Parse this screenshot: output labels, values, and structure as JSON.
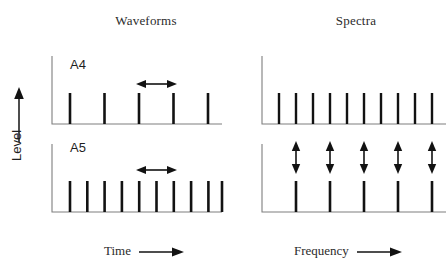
{
  "figure": {
    "columns": {
      "left_title": "Waveforms",
      "right_title": "Spectra"
    },
    "axis_labels": {
      "y": "Level",
      "y_arrow": "up-arrow",
      "x_left": "Time",
      "x_right": "Frequency",
      "x_arrow": "right-arrow"
    },
    "panels": [
      {
        "id": "a4-waveform",
        "label": "A4"
      },
      {
        "id": "a4-spectrum",
        "label": ""
      },
      {
        "id": "a5-waveform",
        "label": "A5"
      },
      {
        "id": "a5-spectrum",
        "label": ""
      }
    ],
    "colors": {
      "ink": "#121212",
      "axis": "#7f7f7f",
      "text": "#2b2b2b",
      "background": "#ffffff"
    }
  },
  "chart_data": [
    {
      "type": "bar",
      "id": "a4-waveform",
      "title": "A4",
      "panel_group": "Waveforms",
      "xlabel": "Time",
      "ylabel": "Level",
      "grid": false,
      "legend": "none",
      "x": [
        70,
        104.5,
        139,
        173.5,
        208
      ],
      "values": [
        1,
        1,
        1,
        1,
        1
      ],
      "axis_origin_x": 52,
      "axis_baseline_y": 124,
      "axis_top_y": 56,
      "axis_right_x": 222,
      "spike_top_y": 93,
      "annotations": [
        {
          "type": "double-arrow-horizontal",
          "meaning": "period",
          "x1": 139,
          "x2": 173.5,
          "y": 84
        }
      ]
    },
    {
      "type": "bar",
      "id": "a4-spectrum",
      "title": "",
      "panel_group": "Spectra",
      "xlabel": "Frequency",
      "ylabel": "Level",
      "grid": false,
      "legend": "none",
      "x": [
        279,
        296,
        313,
        330,
        347,
        364,
        381,
        398,
        415,
        432
      ],
      "values": [
        1,
        1,
        1,
        1,
        1,
        1,
        1,
        1,
        1,
        1
      ],
      "axis_origin_x": 262,
      "axis_baseline_y": 124,
      "axis_top_y": 56,
      "axis_right_x": 446,
      "spike_top_y": 93,
      "annotations": []
    },
    {
      "type": "bar",
      "id": "a5-waveform",
      "title": "A5",
      "panel_group": "Waveforms",
      "xlabel": "Time",
      "ylabel": "Level",
      "grid": false,
      "legend": "none",
      "x": [
        70,
        87.3,
        104.6,
        121.9,
        139.2,
        156.5,
        173.8,
        191.1,
        208.4,
        222
      ],
      "values": [
        1,
        1,
        1,
        1,
        1,
        1,
        1,
        1,
        1,
        1
      ],
      "axis_origin_x": 52,
      "axis_baseline_y": 212,
      "axis_top_y": 144,
      "axis_right_x": 222,
      "spike_top_y": 181,
      "annotations": [
        {
          "type": "double-arrow-horizontal",
          "meaning": "period",
          "x1": 139.2,
          "x2": 173.8,
          "y": 170
        }
      ]
    },
    {
      "type": "bar",
      "id": "a5-spectrum",
      "title": "",
      "panel_group": "Spectra",
      "xlabel": "Frequency",
      "ylabel": "Level",
      "grid": false,
      "legend": "none",
      "x": [
        296,
        330,
        364,
        398,
        432
      ],
      "values": [
        1,
        1,
        1,
        1,
        1
      ],
      "axis_origin_x": 262,
      "axis_baseline_y": 212,
      "axis_top_y": 144,
      "axis_right_x": 446,
      "spike_top_y": 181,
      "annotations": [
        {
          "type": "double-arrow-vertical",
          "meaning": "harmonic-spacing",
          "x": 296,
          "y1": 141,
          "y2": 174
        },
        {
          "type": "double-arrow-vertical",
          "meaning": "harmonic-spacing",
          "x": 330,
          "y1": 141,
          "y2": 174
        },
        {
          "type": "double-arrow-vertical",
          "meaning": "harmonic-spacing",
          "x": 364,
          "y1": 141,
          "y2": 174
        },
        {
          "type": "double-arrow-vertical",
          "meaning": "harmonic-spacing",
          "x": 398,
          "y1": 141,
          "y2": 174
        },
        {
          "type": "double-arrow-vertical",
          "meaning": "harmonic-spacing",
          "x": 432,
          "y1": 141,
          "y2": 174
        }
      ]
    }
  ]
}
